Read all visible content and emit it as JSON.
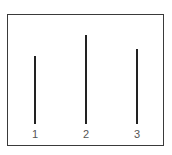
{
  "figure": {
    "frame_color": "#3a3a3a",
    "line_color": "#222222",
    "label_color": "#555555",
    "lines": [
      {
        "label": "1",
        "x": 35,
        "top": 56,
        "bottom": 124,
        "relative_length": 68
      },
      {
        "label": "2",
        "x": 86,
        "top": 35,
        "bottom": 124,
        "relative_length": 89
      },
      {
        "label": "3",
        "x": 137,
        "top": 49,
        "bottom": 124,
        "relative_length": 75
      }
    ]
  }
}
